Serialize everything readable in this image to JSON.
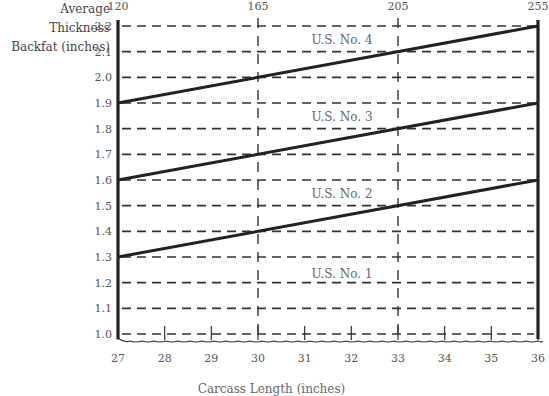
{
  "chart_data": {
    "type": "line",
    "title": "",
    "ylabel": "Average Thickness Backfat (inches)",
    "xlabel": "Carcass Length (inches)",
    "ylabel_line1": "Average Thickness",
    "ylabel_line2": "Backfat (inches)",
    "ylim": [
      1.0,
      2.2
    ],
    "xlim": [
      27,
      36
    ],
    "grid": true,
    "y_ticks": [
      "2.2",
      "2.1",
      "2.0",
      "1.9",
      "1.8",
      "1.7",
      "1.6",
      "1.5",
      "1.4",
      "1.3",
      "1.2",
      "1.1",
      "1.0"
    ],
    "x_ticks": [
      "27",
      "28",
      "29",
      "30",
      "31",
      "32",
      "33",
      "34",
      "35",
      "36"
    ],
    "top_axis_ticks": [
      {
        "label": "120",
        "x": 27
      },
      {
        "label": "165",
        "x": 30
      },
      {
        "label": "205",
        "x": 33
      },
      {
        "label": "255",
        "x": 36
      }
    ],
    "series": [
      {
        "name": "U.S. No. 4 / No. 3 boundary",
        "x": [
          27,
          36
        ],
        "values": [
          1.9,
          2.2
        ]
      },
      {
        "name": "U.S. No. 3 / No. 2 boundary",
        "x": [
          27,
          36
        ],
        "values": [
          1.6,
          1.9
        ]
      },
      {
        "name": "U.S. No. 2 / No. 1 boundary",
        "x": [
          27,
          36
        ],
        "values": [
          1.3,
          1.6
        ]
      }
    ],
    "annotations": [
      {
        "text": "U.S. No. 4",
        "x": 31.8,
        "y": 2.14
      },
      {
        "text": "U.S. No. 3",
        "x": 31.8,
        "y": 1.84
      },
      {
        "text": "U.S. No. 2",
        "x": 31.8,
        "y": 1.54
      },
      {
        "text": "U.S. No. 1",
        "x": 31.8,
        "y": 1.23
      }
    ]
  }
}
